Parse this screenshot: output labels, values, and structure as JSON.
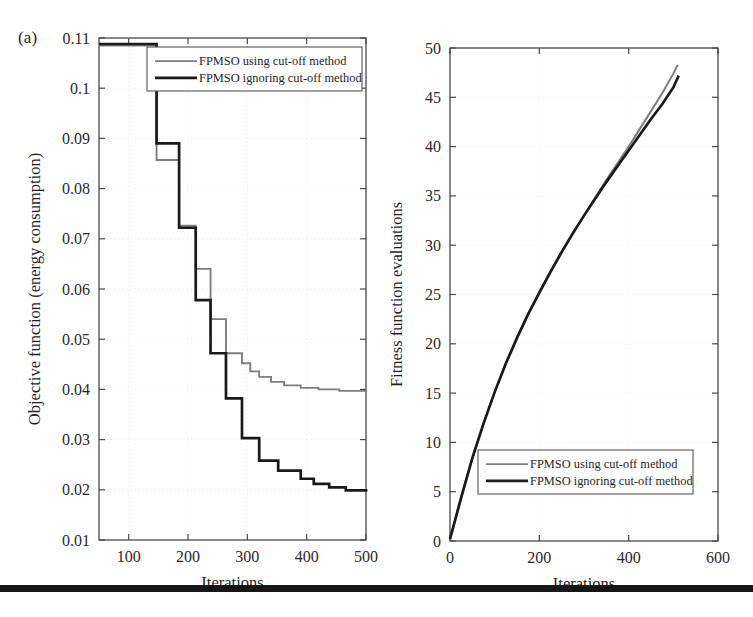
{
  "figure": {
    "panel_label": "(a)",
    "bottom_rule_color": "#161616"
  },
  "colors": {
    "series_using": "#7d7d7d",
    "series_ignoring": "#1a1a1a",
    "axis": "#4a4a4a",
    "grid": "#e8e8e8",
    "text": "#1f1f1f"
  },
  "legend": {
    "using_label": "FPMSO using cut-off method",
    "ignoring_label": "FPMSO ignoring cut-off method"
  },
  "chart_data": [
    {
      "type": "line",
      "id": "objective-function-chart",
      "title": "",
      "xlabel": "Iterations",
      "ylabel": "Objective function (energy consumption)",
      "xlim": [
        50,
        500
      ],
      "ylim": [
        0.01,
        0.11
      ],
      "xticks": [
        100,
        200,
        300,
        400,
        500
      ],
      "yticks": [
        0.01,
        0.02,
        0.03,
        0.04,
        0.05,
        0.06,
        0.07,
        0.08,
        0.09,
        0.1,
        0.11
      ],
      "ytick_labels": [
        "0.01",
        "0.02",
        "0.03",
        "0.04",
        "0.05",
        "0.06",
        "0.07",
        "0.08",
        "0.09",
        "0.1",
        "0.11"
      ],
      "xtick_labels": [
        "100",
        "200",
        "300",
        "400",
        "500"
      ],
      "grid": true,
      "legend_position": "top-center",
      "drawstyle": "steps-post",
      "series": [
        {
          "name": "FPMSO using cut-off method",
          "color": "#7d7d7d",
          "width": 1.9,
          "x": [
            50,
            128,
            147,
            168,
            185,
            196,
            213,
            226,
            238,
            252,
            264,
            278,
            291,
            305,
            320,
            340,
            362,
            390,
            420,
            455,
            500
          ],
          "y": [
            0.1085,
            0.1085,
            0.0857,
            0.0857,
            0.0726,
            0.0726,
            0.064,
            0.064,
            0.054,
            0.054,
            0.0472,
            0.0472,
            0.0452,
            0.0436,
            0.0425,
            0.0415,
            0.0408,
            0.0403,
            0.04,
            0.0397,
            0.0396
          ]
        },
        {
          "name": "FPMSO ignoring cut-off method",
          "color": "#1a1a1a",
          "width": 2.7,
          "x": [
            50,
            128,
            147,
            168,
            185,
            196,
            213,
            226,
            238,
            252,
            264,
            278,
            291,
            305,
            320,
            336,
            352,
            368,
            390,
            412,
            438,
            466,
            500
          ],
          "y": [
            0.1088,
            0.1088,
            0.089,
            0.089,
            0.0722,
            0.0722,
            0.0578,
            0.0578,
            0.0472,
            0.0472,
            0.0382,
            0.0382,
            0.0303,
            0.0303,
            0.0258,
            0.0258,
            0.0238,
            0.0238,
            0.0222,
            0.0212,
            0.0205,
            0.0199,
            0.0196
          ]
        }
      ]
    },
    {
      "type": "line",
      "id": "fitness-function-evaluations-chart",
      "title": "",
      "xlabel": "Iterations",
      "ylabel": "Fitness function evaluations",
      "xlim": [
        0,
        600
      ],
      "ylim": [
        0,
        50
      ],
      "xticks": [
        0,
        200,
        400,
        600
      ],
      "yticks": [
        0,
        5,
        10,
        15,
        20,
        25,
        30,
        35,
        40,
        45,
        50
      ],
      "ytick_labels": [
        "0",
        "5",
        "10",
        "15",
        "20",
        "25",
        "30",
        "35",
        "40",
        "45",
        "50"
      ],
      "xtick_labels": [
        "0",
        "200",
        "400",
        "600"
      ],
      "grid": true,
      "legend_position": "bottom-center",
      "drawstyle": "line",
      "series": [
        {
          "name": "FPMSO using cut-off method",
          "color": "#7d7d7d",
          "width": 2.0,
          "x": [
            0,
            25,
            50,
            75,
            100,
            125,
            150,
            175,
            200,
            225,
            250,
            275,
            300,
            325,
            350,
            375,
            400,
            425,
            450,
            475,
            500,
            510
          ],
          "y": [
            0.2,
            4.4,
            8.4,
            11.9,
            15.1,
            18.0,
            20.6,
            23.0,
            25.2,
            27.3,
            29.3,
            31.2,
            33.0,
            34.8,
            36.6,
            38.3,
            40.0,
            41.8,
            43.6,
            45.4,
            47.4,
            48.3
          ]
        },
        {
          "name": "FPMSO ignoring cut-off method",
          "color": "#1a1a1a",
          "width": 2.7,
          "x": [
            0,
            25,
            50,
            75,
            100,
            125,
            150,
            175,
            200,
            225,
            250,
            275,
            300,
            325,
            350,
            375,
            400,
            425,
            450,
            475,
            500,
            512
          ],
          "y": [
            0.2,
            4.4,
            8.4,
            11.9,
            15.1,
            18.0,
            20.6,
            23.0,
            25.2,
            27.3,
            29.3,
            31.2,
            33.0,
            34.7,
            36.4,
            38.0,
            39.6,
            41.2,
            42.8,
            44.3,
            46.0,
            47.2
          ]
        }
      ]
    }
  ]
}
